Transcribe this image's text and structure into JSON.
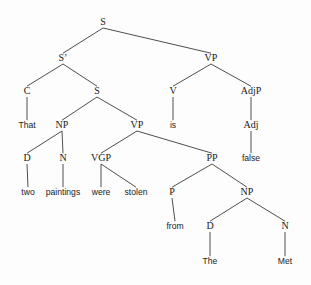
{
  "figure": {
    "kind": "syntax-tree",
    "notation": "phrase-structure-tree",
    "sentence": "That two paintings were stolen from The Met is false",
    "background_color": "#fdfdfd",
    "line_color": "#3a3a3a",
    "text_color": "#1a1a1a"
  },
  "nodes": [
    {
      "id": "S-root",
      "label": "S",
      "type": "nonterminal",
      "x": 103,
      "y": 25
    },
    {
      "id": "Sbar",
      "label": "S’",
      "type": "nonterminal",
      "x": 63,
      "y": 61
    },
    {
      "id": "VP-main",
      "label": "VP",
      "type": "nonterminal",
      "x": 211,
      "y": 61
    },
    {
      "id": "C",
      "label": "C",
      "type": "nonterminal",
      "x": 27,
      "y": 94
    },
    {
      "id": "S-embed",
      "label": "S",
      "type": "nonterminal",
      "x": 97,
      "y": 94
    },
    {
      "id": "V",
      "label": "V",
      "type": "nonterminal",
      "x": 173,
      "y": 94
    },
    {
      "id": "AdjP",
      "label": "AdjP",
      "type": "nonterminal",
      "x": 251,
      "y": 94
    },
    {
      "id": "That",
      "label": "That",
      "type": "terminal",
      "x": 27,
      "y": 128
    },
    {
      "id": "NP-subj",
      "label": "NP",
      "type": "nonterminal",
      "x": 62,
      "y": 128
    },
    {
      "id": "VP-embed",
      "label": "VP",
      "type": "nonterminal",
      "x": 137,
      "y": 128
    },
    {
      "id": "is",
      "label": "is",
      "type": "terminal",
      "x": 173,
      "y": 128
    },
    {
      "id": "Adj",
      "label": "Adj",
      "type": "nonterminal",
      "x": 251,
      "y": 128
    },
    {
      "id": "D-subj",
      "label": "D",
      "type": "nonterminal",
      "x": 27,
      "y": 161
    },
    {
      "id": "N-subj",
      "label": "N",
      "type": "nonterminal",
      "x": 63,
      "y": 161
    },
    {
      "id": "VGP",
      "label": "VGP",
      "type": "nonterminal",
      "x": 101,
      "y": 161
    },
    {
      "id": "PP",
      "label": "PP",
      "type": "nonterminal",
      "x": 212,
      "y": 161
    },
    {
      "id": "false",
      "label": "false",
      "type": "terminal",
      "x": 251,
      "y": 161
    },
    {
      "id": "two",
      "label": "two",
      "type": "terminal",
      "x": 28,
      "y": 195
    },
    {
      "id": "paintings",
      "label": "paintings",
      "type": "terminal",
      "x": 63,
      "y": 195
    },
    {
      "id": "were",
      "label": "were",
      "type": "terminal",
      "x": 101,
      "y": 195
    },
    {
      "id": "stolen",
      "label": "stolen",
      "type": "terminal",
      "x": 136,
      "y": 195
    },
    {
      "id": "P",
      "label": "P",
      "type": "nonterminal",
      "x": 172,
      "y": 195
    },
    {
      "id": "NP-obj",
      "label": "NP",
      "type": "nonterminal",
      "x": 247,
      "y": 195
    },
    {
      "id": "from",
      "label": "from",
      "type": "terminal",
      "x": 175,
      "y": 229
    },
    {
      "id": "D-obj",
      "label": "D",
      "type": "nonterminal",
      "x": 210,
      "y": 229
    },
    {
      "id": "N-obj",
      "label": "N",
      "type": "nonterminal",
      "x": 285,
      "y": 229
    },
    {
      "id": "The",
      "label": "The",
      "type": "terminal",
      "x": 210,
      "y": 264
    },
    {
      "id": "Met",
      "label": "Met",
      "type": "terminal",
      "x": 285,
      "y": 264
    }
  ],
  "edges": [
    {
      "from": "S-root",
      "to": "Sbar"
    },
    {
      "from": "S-root",
      "to": "VP-main"
    },
    {
      "from": "Sbar",
      "to": "C"
    },
    {
      "from": "Sbar",
      "to": "S-embed"
    },
    {
      "from": "VP-main",
      "to": "V"
    },
    {
      "from": "VP-main",
      "to": "AdjP"
    },
    {
      "from": "C",
      "to": "That"
    },
    {
      "from": "S-embed",
      "to": "NP-subj"
    },
    {
      "from": "S-embed",
      "to": "VP-embed"
    },
    {
      "from": "V",
      "to": "is"
    },
    {
      "from": "AdjP",
      "to": "Adj"
    },
    {
      "from": "NP-subj",
      "to": "D-subj"
    },
    {
      "from": "NP-subj",
      "to": "N-subj"
    },
    {
      "from": "VP-embed",
      "to": "VGP"
    },
    {
      "from": "VP-embed",
      "to": "PP"
    },
    {
      "from": "Adj",
      "to": "false"
    },
    {
      "from": "D-subj",
      "to": "two"
    },
    {
      "from": "N-subj",
      "to": "paintings"
    },
    {
      "from": "VGP",
      "to": "were"
    },
    {
      "from": "VGP",
      "to": "stolen"
    },
    {
      "from": "PP",
      "to": "P"
    },
    {
      "from": "PP",
      "to": "NP-obj"
    },
    {
      "from": "P",
      "to": "from"
    },
    {
      "from": "NP-obj",
      "to": "D-obj"
    },
    {
      "from": "NP-obj",
      "to": "N-obj"
    },
    {
      "from": "D-obj",
      "to": "The"
    },
    {
      "from": "N-obj",
      "to": "Met"
    }
  ]
}
